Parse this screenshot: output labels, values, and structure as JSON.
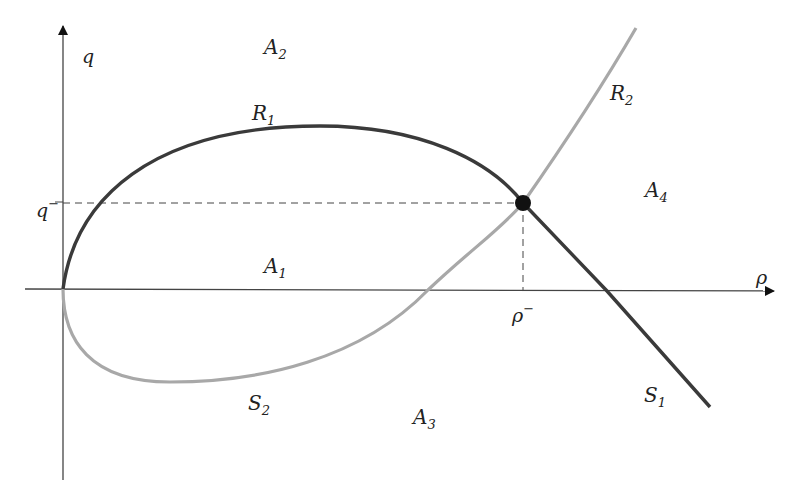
{
  "axes": {
    "x_label": "ρ",
    "y_label": "q",
    "x_tick_label": "ρ",
    "x_tick_sup": "−",
    "y_tick_label": "q",
    "y_tick_sup": "−"
  },
  "curves": {
    "R1": {
      "name": "R",
      "sub": "1",
      "color": "#3a3a3a"
    },
    "R2": {
      "name": "R",
      "sub": "2",
      "color": "#a8a8a8"
    },
    "S1": {
      "name": "S",
      "sub": "1",
      "color": "#3a3a3a"
    },
    "S2": {
      "name": "S",
      "sub": "2",
      "color": "#a8a8a8"
    }
  },
  "regions": {
    "A1": {
      "name": "A",
      "sub": "1"
    },
    "A2": {
      "name": "A",
      "sub": "2"
    },
    "A3": {
      "name": "A",
      "sub": "3"
    },
    "A4": {
      "name": "A",
      "sub": "4"
    }
  },
  "point": {
    "label": "(ρ⁻, q⁻)"
  }
}
